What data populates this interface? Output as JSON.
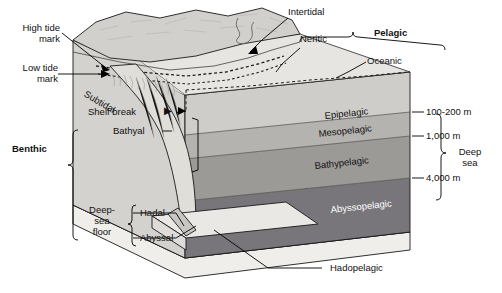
{
  "diagram": {
    "colors": {
      "land": "#cfcdc9",
      "land_top": "#d9d7d3",
      "shelf": "#e2e0dc",
      "epipelagic": "#cfcdc9",
      "mesopelagic": "#b3b1ad",
      "bathypelagic": "#9a9895",
      "abyssopelagic": "#78767a",
      "base": "#efeeea",
      "outline": "#1a1a1a",
      "leader": "#000000"
    }
  },
  "labels": {
    "high_tide": "High tide\nmark",
    "low_tide": "Low tide\nmark",
    "intertidal": "Intertidal",
    "neritic": "Neritic",
    "pelagic": "Pelagic",
    "oceanic": "Oceanic",
    "subtidal": "Subtidal",
    "shelf_break": "Shelf break",
    "bathyal": "Bathyal",
    "benthic": "Benthic",
    "deep_sea_floor": "Deep-\nsea\nfloor",
    "hadal": "Hadal",
    "abyssal": "Abyssal",
    "hadopelagic": "Hadopelagic"
  },
  "pelagic_zones": [
    {
      "name": "Epipelagic",
      "depth": "100-200 m"
    },
    {
      "name": "Mesopelagic",
      "depth": "1,000 m"
    },
    {
      "name": "Bathypelagic",
      "depth": "4,000 m"
    },
    {
      "name": "Abyssopelagic",
      "depth": ""
    }
  ],
  "deep_sea": {
    "label": "Deep\nsea"
  },
  "arrows": {
    "shelf_break_arrow": "▶"
  }
}
